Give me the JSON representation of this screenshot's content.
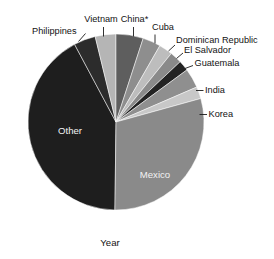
{
  "chart_data": {
    "type": "pie",
    "title": "",
    "subtitle": "",
    "xlabel": "Year",
    "ylabel": "",
    "legend_position": "none",
    "grid": false,
    "labels_inside": [
      "Other",
      "Mexico"
    ],
    "note": "Grayscale pie chart of immigration by country of origin; slices labeled with external leader lines except Mexico and Other which are labeled inside.",
    "categories": [
      "China*",
      "Cuba",
      "Dominican Republic",
      "El Salvador",
      "Guatemala",
      "India",
      "Korea",
      "Mexico",
      "Other",
      "Philippines",
      "Vietnam"
    ],
    "values": [
      5.0,
      3.3,
      2.5,
      2.2,
      1.9,
      3.6,
      2.2,
      29.5,
      42.0,
      4.0,
      3.8
    ],
    "units": "percent",
    "colors": [
      "#5e5e5e",
      "#8e8e8e",
      "#bdbdbd",
      "#8a8a8a",
      "#232323",
      "#8f8f8f",
      "#c8c8c8",
      "#8a8a8a",
      "#1e1e1e",
      "#2c2c2c",
      "#b5b5b5"
    ],
    "slices": [
      {
        "label": "China*",
        "value": 5.0,
        "color": "#5e5e5e",
        "start_angle": 0.0,
        "end_angle": 18.0,
        "label_placement": "outside"
      },
      {
        "label": "Cuba",
        "value": 3.3,
        "color": "#8e8e8e",
        "start_angle": 18.0,
        "end_angle": 29.9,
        "label_placement": "outside"
      },
      {
        "label": "Dominican Republic",
        "value": 2.5,
        "color": "#bdbdbd",
        "start_angle": 29.9,
        "end_angle": 38.9,
        "label_placement": "outside"
      },
      {
        "label": "El Salvador",
        "value": 2.2,
        "color": "#8a8a8a",
        "start_angle": 38.9,
        "end_angle": 46.8,
        "label_placement": "outside"
      },
      {
        "label": "Guatemala",
        "value": 1.9,
        "color": "#232323",
        "start_angle": 46.8,
        "end_angle": 53.7,
        "label_placement": "outside"
      },
      {
        "label": "India",
        "value": 3.6,
        "color": "#8f8f8f",
        "start_angle": 53.7,
        "end_angle": 66.6,
        "label_placement": "outside"
      },
      {
        "label": "Korea",
        "value": 2.2,
        "color": "#c8c8c8",
        "start_angle": 66.6,
        "end_angle": 74.5,
        "label_placement": "outside"
      },
      {
        "label": "Mexico",
        "value": 29.5,
        "color": "#8a8a8a",
        "start_angle": 74.5,
        "end_angle": 180.7,
        "label_placement": "inside"
      },
      {
        "label": "Other",
        "value": 42.0,
        "color": "#1e1e1e",
        "start_angle": 180.7,
        "end_angle": 331.9,
        "label_placement": "inside"
      },
      {
        "label": "Philippines",
        "value": 4.0,
        "color": "#2c2c2c",
        "start_angle": 331.9,
        "end_angle": 346.3,
        "label_placement": "outside"
      },
      {
        "label": "Vietnam",
        "value": 3.8,
        "color": "#b5b5b5",
        "start_angle": 346.3,
        "end_angle": 360.0,
        "label_placement": "outside"
      }
    ]
  },
  "labels": {
    "philippines": "Philippines",
    "vietnam": "Vietnam",
    "china": "China*",
    "cuba": "Cuba",
    "dominican_republic": "Dominican Republic",
    "el_salvador": "El Salvador",
    "guatemala": "Guatemala",
    "india": "India",
    "korea": "Korea",
    "mexico": "Mexico",
    "other": "Other",
    "year": "Year"
  }
}
